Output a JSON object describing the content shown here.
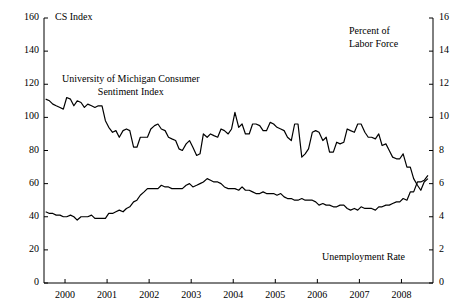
{
  "chart_data": {
    "type": "line",
    "title": "",
    "subtitle": "",
    "xlabel": "",
    "ylabel": "CS Index",
    "y2label": "Percent of Labor Force",
    "grid": false,
    "legend_position": "inline-annotations",
    "xlim": [
      1999.5,
      2008.75
    ],
    "ylim": [
      0,
      160
    ],
    "y2lim": [
      0,
      16
    ],
    "x_ticks": [
      "2000",
      "2001",
      "2002",
      "2003",
      "2004",
      "2005",
      "2006",
      "2007",
      "2008"
    ],
    "y_ticks": [
      "0",
      "20",
      "40",
      "60",
      "80",
      "100",
      "120",
      "140",
      "160"
    ],
    "y2_ticks": [
      "0",
      "2",
      "4",
      "6",
      "8",
      "10",
      "12",
      "14",
      "16"
    ],
    "annotations": [
      {
        "name": "sentiment-annotation",
        "line1": "University of Michigan Consumer",
        "line2": "Sentiment Index"
      },
      {
        "name": "unemployment-annotation",
        "line1": "Unemployment Rate",
        "line2": ""
      }
    ],
    "series": [
      {
        "name": "University of Michigan Consumer Sentiment Index",
        "axis": "left",
        "x": [
          1999.54,
          1999.63,
          1999.71,
          1999.79,
          1999.88,
          1999.96,
          2000.04,
          2000.13,
          2000.21,
          2000.29,
          2000.38,
          2000.46,
          2000.54,
          2000.63,
          2000.71,
          2000.79,
          2000.88,
          2000.96,
          2001.04,
          2001.13,
          2001.21,
          2001.29,
          2001.38,
          2001.46,
          2001.54,
          2001.63,
          2001.71,
          2001.79,
          2001.88,
          2001.96,
          2002.04,
          2002.13,
          2002.21,
          2002.29,
          2002.38,
          2002.46,
          2002.54,
          2002.63,
          2002.71,
          2002.79,
          2002.88,
          2002.96,
          2003.04,
          2003.13,
          2003.21,
          2003.29,
          2003.38,
          2003.46,
          2003.54,
          2003.63,
          2003.71,
          2003.79,
          2003.88,
          2003.96,
          2004.04,
          2004.13,
          2004.21,
          2004.29,
          2004.38,
          2004.46,
          2004.54,
          2004.63,
          2004.71,
          2004.79,
          2004.88,
          2004.96,
          2005.04,
          2005.13,
          2005.21,
          2005.29,
          2005.38,
          2005.46,
          2005.54,
          2005.63,
          2005.71,
          2005.79,
          2005.88,
          2005.96,
          2006.04,
          2006.13,
          2006.21,
          2006.29,
          2006.38,
          2006.46,
          2006.54,
          2006.63,
          2006.71,
          2006.79,
          2006.88,
          2006.96,
          2007.04,
          2007.13,
          2007.21,
          2007.29,
          2007.38,
          2007.46,
          2007.54,
          2007.63,
          2007.71,
          2007.79,
          2007.88,
          2007.96,
          2008.04,
          2008.13,
          2008.21,
          2008.29,
          2008.38,
          2008.46,
          2008.54,
          2008.63
        ],
        "y": [
          111,
          110,
          108,
          107,
          106,
          105,
          112,
          111,
          107,
          110,
          109,
          106,
          108,
          107,
          106,
          107,
          107,
          98,
          94,
          91,
          92,
          88,
          92,
          93,
          92,
          82,
          82,
          88,
          88,
          88,
          93,
          95,
          96,
          93,
          92,
          88,
          87,
          86,
          81,
          80,
          84,
          86,
          82,
          77,
          78,
          90,
          88,
          90,
          89,
          88,
          93,
          92,
          90,
          93,
          103,
          94,
          96,
          90,
          90,
          96,
          96,
          95,
          92,
          92,
          97,
          96,
          94,
          93,
          92,
          88,
          86,
          96,
          96,
          76,
          78,
          81,
          91,
          92,
          91,
          86,
          88,
          79,
          79,
          85,
          84,
          85,
          93,
          92,
          91,
          96,
          96,
          91,
          88,
          88,
          87,
          90,
          83,
          84,
          80,
          76,
          75,
          75,
          78,
          70,
          70,
          63,
          59,
          56,
          61,
          63
        ]
      },
      {
        "name": "Unemployment Rate",
        "axis": "right",
        "x": [
          1999.54,
          1999.63,
          1999.71,
          1999.79,
          1999.88,
          1999.96,
          2000.04,
          2000.13,
          2000.21,
          2000.29,
          2000.38,
          2000.46,
          2000.54,
          2000.63,
          2000.71,
          2000.79,
          2000.88,
          2000.96,
          2001.04,
          2001.13,
          2001.21,
          2001.29,
          2001.38,
          2001.46,
          2001.54,
          2001.63,
          2001.71,
          2001.79,
          2001.88,
          2001.96,
          2002.04,
          2002.13,
          2002.21,
          2002.29,
          2002.38,
          2002.46,
          2002.54,
          2002.63,
          2002.71,
          2002.79,
          2002.88,
          2002.96,
          2003.04,
          2003.13,
          2003.21,
          2003.29,
          2003.38,
          2003.46,
          2003.54,
          2003.63,
          2003.71,
          2003.79,
          2003.88,
          2003.96,
          2004.04,
          2004.13,
          2004.21,
          2004.29,
          2004.38,
          2004.46,
          2004.54,
          2004.63,
          2004.71,
          2004.79,
          2004.88,
          2004.96,
          2005.04,
          2005.13,
          2005.21,
          2005.29,
          2005.38,
          2005.46,
          2005.54,
          2005.63,
          2005.71,
          2005.79,
          2005.88,
          2005.96,
          2006.04,
          2006.13,
          2006.21,
          2006.29,
          2006.38,
          2006.46,
          2006.54,
          2006.63,
          2006.71,
          2006.79,
          2006.88,
          2006.96,
          2007.04,
          2007.13,
          2007.21,
          2007.29,
          2007.38,
          2007.46,
          2007.54,
          2007.63,
          2007.71,
          2007.79,
          2007.88,
          2007.96,
          2008.04,
          2008.13,
          2008.21,
          2008.29,
          2008.38,
          2008.46,
          2008.54,
          2008.63
        ],
        "y": [
          4.3,
          4.2,
          4.2,
          4.1,
          4.1,
          4.0,
          4.0,
          4.1,
          4.0,
          3.8,
          4.0,
          4.0,
          4.0,
          4.1,
          3.9,
          3.9,
          3.9,
          3.9,
          4.2,
          4.2,
          4.3,
          4.4,
          4.3,
          4.5,
          4.6,
          4.9,
          5.0,
          5.3,
          5.5,
          5.7,
          5.7,
          5.7,
          5.7,
          5.9,
          5.8,
          5.8,
          5.7,
          5.7,
          5.7,
          5.7,
          5.9,
          6.0,
          5.8,
          5.9,
          6.0,
          6.1,
          6.3,
          6.2,
          6.1,
          6.1,
          6.0,
          5.8,
          5.7,
          5.7,
          5.7,
          5.6,
          5.8,
          5.6,
          5.6,
          5.5,
          5.4,
          5.4,
          5.5,
          5.4,
          5.4,
          5.4,
          5.3,
          5.4,
          5.2,
          5.1,
          5.1,
          5.0,
          5.0,
          5.1,
          5.0,
          5.0,
          5.0,
          4.9,
          4.7,
          4.8,
          4.7,
          4.7,
          4.6,
          4.6,
          4.7,
          4.7,
          4.5,
          4.4,
          4.5,
          4.4,
          4.6,
          4.5,
          4.5,
          4.5,
          4.4,
          4.6,
          4.6,
          4.7,
          4.7,
          4.8,
          4.9,
          4.9,
          5.1,
          5.0,
          5.5,
          5.5,
          6.1,
          6.1,
          6.2,
          6.5
        ]
      }
    ]
  }
}
